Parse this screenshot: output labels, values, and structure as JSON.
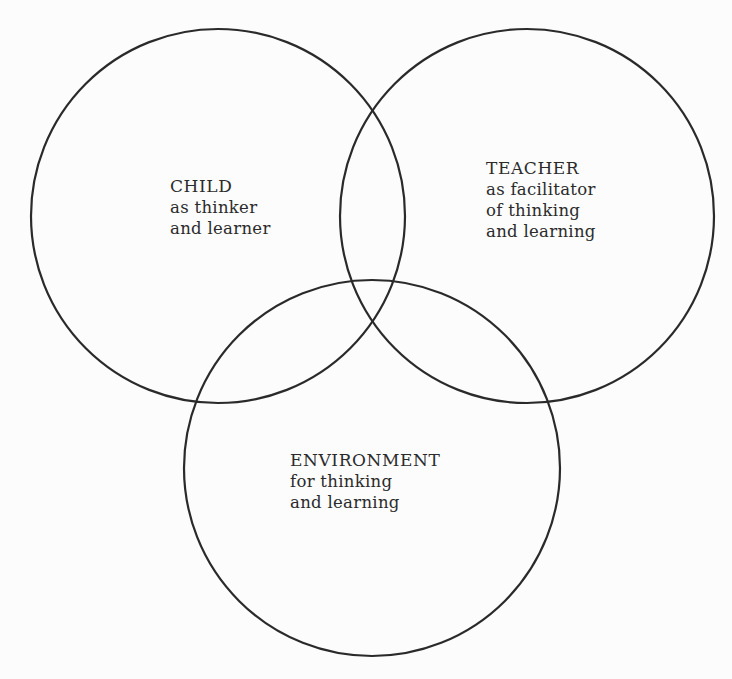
{
  "diagram": {
    "type": "venn",
    "set_count": 3,
    "stroke_color": "#2a2a2a",
    "background_color": "#fcfcfc",
    "circles": [
      {
        "id": "child",
        "title": "CHILD",
        "lines": [
          "as thinker",
          "and learner"
        ],
        "cx": 218,
        "cy": 216,
        "r": 187
      },
      {
        "id": "teacher",
        "title": "TEACHER",
        "lines": [
          "as facilitator",
          "of thinking",
          "and learning"
        ],
        "cx": 527,
        "cy": 216,
        "r": 187
      },
      {
        "id": "environment",
        "title": "ENVIRONMENT",
        "lines": [
          "for thinking",
          "and learning"
        ],
        "cx": 372,
        "cy": 468,
        "r": 188
      }
    ]
  }
}
